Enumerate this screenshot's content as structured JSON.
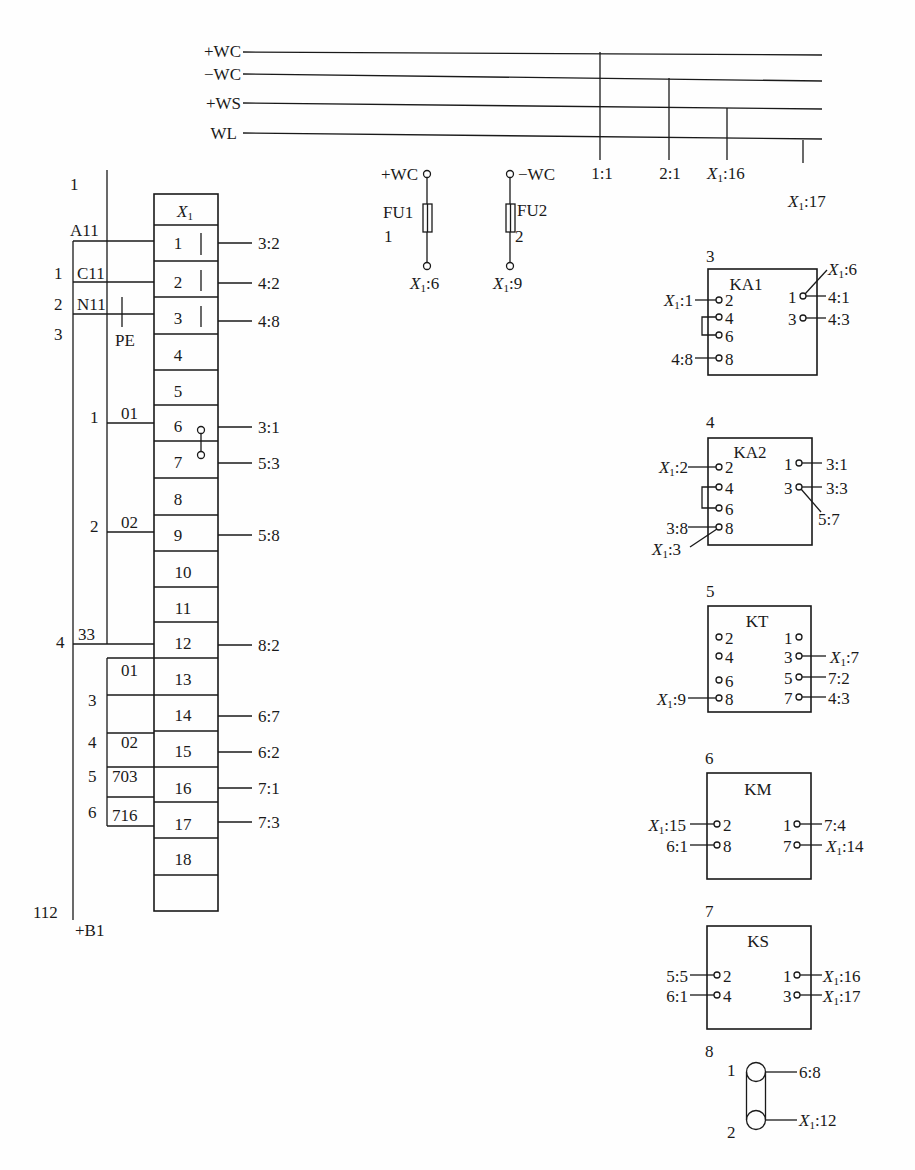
{
  "buses": [
    {
      "label": "+WC"
    },
    {
      "label": "−WC"
    },
    {
      "label": "+WS"
    },
    {
      "label": "WL"
    }
  ],
  "bus_taps": [
    {
      "label": "1:1"
    },
    {
      "label": "2:1"
    },
    {
      "label": "16"
    },
    {
      "label": "17"
    }
  ],
  "terminal_prefix": "X",
  "terminal_prefix_sub": "1",
  "fuses": [
    {
      "supply": "+WC",
      "name": "FU1",
      "number": "1",
      "dest": "6"
    },
    {
      "supply": "−WC",
      "name": "FU2",
      "number": "2",
      "dest": "9"
    }
  ],
  "terminal_block": {
    "header": "X1",
    "terminals": [
      "1",
      "2",
      "3",
      "4",
      "5",
      "6",
      "7",
      "8",
      "9",
      "10",
      "11",
      "12",
      "13",
      "14",
      "15",
      "16",
      "17",
      "18",
      ""
    ],
    "right_connections": [
      {
        "terminal": "1",
        "to": "3:2"
      },
      {
        "terminal": "2",
        "to": "4:2"
      },
      {
        "terminal": "3",
        "to": "4:8"
      },
      {
        "terminal": "6",
        "to": "3:1"
      },
      {
        "terminal": "7",
        "to": "5:3"
      },
      {
        "terminal": "9",
        "to": "5:8"
      },
      {
        "terminal": "12",
        "to": "8:2"
      },
      {
        "terminal": "14",
        "to": "6:7"
      },
      {
        "terminal": "15",
        "to": "6:2"
      },
      {
        "terminal": "16",
        "to": "7:1"
      },
      {
        "terminal": "17",
        "to": "7:3"
      }
    ]
  },
  "cable_left": {
    "outer_labels": [
      "1",
      "1",
      "2",
      "3",
      "4",
      "112"
    ],
    "wire_labels": [
      "A11",
      "C11",
      "N11",
      "PE",
      "33"
    ],
    "cable_name": "+B1"
  },
  "cable_mid": {
    "side_numbers": [
      "1",
      "2",
      "3",
      "4",
      "5",
      "6"
    ],
    "wire_labels": [
      "01",
      "02",
      "01",
      "02",
      "703",
      "716"
    ]
  },
  "devices": [
    {
      "index": "3",
      "name": "KA1",
      "left_pins": [
        {
          "pin": "2",
          "to": "X1:1"
        },
        {
          "pin": "4",
          "to": ""
        },
        {
          "pin": "6",
          "to": ""
        },
        {
          "pin": "8",
          "to": "4:8"
        }
      ],
      "right_pins": [
        {
          "pin": "1",
          "to": "4:1"
        },
        {
          "pin": "3",
          "to": "4:3"
        }
      ],
      "extra": [
        {
          "pin": "1",
          "to": "X1:6"
        }
      ]
    },
    {
      "index": "4",
      "name": "KA2",
      "left_pins": [
        {
          "pin": "2",
          "to": "X1:2"
        },
        {
          "pin": "4",
          "to": ""
        },
        {
          "pin": "6",
          "to": ""
        },
        {
          "pin": "8",
          "to": "3:8"
        }
      ],
      "right_pins": [
        {
          "pin": "1",
          "to": "3:1"
        },
        {
          "pin": "3",
          "to": "3:3"
        }
      ],
      "extra": [
        {
          "pin": "3",
          "to": "5:7"
        },
        {
          "pin": "8",
          "to": "X1:3"
        }
      ]
    },
    {
      "index": "5",
      "name": "KT",
      "left_pins": [
        {
          "pin": "2",
          "to": ""
        },
        {
          "pin": "4",
          "to": ""
        },
        {
          "pin": "6",
          "to": ""
        },
        {
          "pin": "8",
          "to": "X1:9"
        }
      ],
      "right_pins": [
        {
          "pin": "1",
          "to": ""
        },
        {
          "pin": "3",
          "to": "X1:7"
        },
        {
          "pin": "5",
          "to": "7:2"
        },
        {
          "pin": "7",
          "to": "4:3"
        }
      ]
    },
    {
      "index": "6",
      "name": "KM",
      "left_pins": [
        {
          "pin": "2",
          "to": "X1:15"
        },
        {
          "pin": "8",
          "to": "6:1"
        }
      ],
      "right_pins": [
        {
          "pin": "1",
          "to": "7:4"
        },
        {
          "pin": "7",
          "to": "X1:14"
        }
      ]
    },
    {
      "index": "7",
      "name": "KS",
      "left_pins": [
        {
          "pin": "2",
          "to": "5:5"
        },
        {
          "pin": "4",
          "to": "6:1"
        }
      ],
      "right_pins": [
        {
          "pin": "1",
          "to": "X1:16"
        },
        {
          "pin": "3",
          "to": "X1:17"
        }
      ]
    },
    {
      "index": "8",
      "name": "resistor",
      "pins": [
        {
          "pin": "1",
          "to": "6:8"
        },
        {
          "pin": "2",
          "to": "X1:12"
        }
      ]
    }
  ],
  "labels": {
    "x1_prefix": "X",
    "x1_sub": "1"
  }
}
